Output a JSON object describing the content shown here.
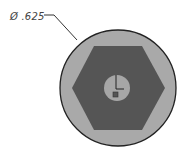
{
  "dimension": {
    "symbol": "Ø",
    "value": ".625",
    "text": "Ø .625"
  },
  "colors": {
    "outer_fill": "#a9a9a9",
    "hex_fill": "#555555",
    "inner_fill": "#a6a6a6",
    "outline": "#222222"
  }
}
